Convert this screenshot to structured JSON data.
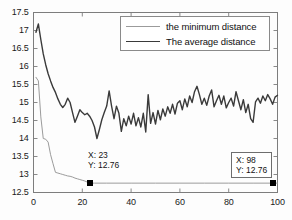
{
  "figure": {
    "background": "#ffffff",
    "axis_color": "#7d7d7d"
  },
  "legend": {
    "position": "top-right-inside",
    "entries": [
      {
        "label": "the minimum distance",
        "color": "#9b9b9b",
        "name": "legend-item-minimum"
      },
      {
        "label": "The average distance",
        "color": "#3a3a3a",
        "name": "legend-item-average"
      }
    ]
  },
  "datatips": [
    {
      "x_label": "X: 23",
      "y_label": "Y: 12.76",
      "x": 23,
      "y": 12.76,
      "boxed": false
    },
    {
      "x_label": "X: 98",
      "y_label": "Y: 12.76",
      "x": 98,
      "y": 12.76,
      "boxed": true
    }
  ],
  "axes": {
    "x_ticks": [
      "0",
      "20",
      "40",
      "60",
      "80",
      "100"
    ],
    "y_ticks": [
      "12.5",
      "13",
      "13.5",
      "14",
      "14.5",
      "15",
      "15.5",
      "16",
      "16.5",
      "17",
      "17.5"
    ]
  },
  "chart_data": {
    "type": "line",
    "title": "",
    "xlabel": "",
    "ylabel": "",
    "xlim": [
      0,
      100
    ],
    "ylim": [
      12.5,
      17.5
    ],
    "xticks": [
      0,
      20,
      40,
      60,
      80,
      100
    ],
    "yticks": [
      12.5,
      13,
      13.5,
      14,
      14.5,
      15,
      15.5,
      16,
      16.5,
      17,
      17.5
    ],
    "grid": false,
    "legend_position": "upper right",
    "annotations": [
      {
        "text": "X: 23\nY: 12.76",
        "x": 23,
        "y": 12.76
      },
      {
        "text": "X: 98\nY: 12.76",
        "x": 98,
        "y": 12.76
      }
    ],
    "series": [
      {
        "name": "the minimum distance",
        "color": "#9b9b9b",
        "width": 1,
        "x": [
          1,
          2,
          3,
          4,
          5,
          6,
          7,
          8,
          9,
          10,
          11,
          12,
          13,
          14,
          15,
          16,
          17,
          18,
          19,
          20,
          21,
          22,
          23,
          24,
          25,
          30,
          40,
          50,
          60,
          70,
          80,
          90,
          98,
          100
        ],
        "values": [
          15.7,
          15.6,
          14.6,
          14.0,
          13.98,
          13.9,
          13.55,
          13.3,
          13.06,
          13.04,
          13.02,
          13.0,
          12.98,
          12.96,
          12.95,
          12.93,
          12.9,
          12.88,
          12.86,
          12.84,
          12.82,
          12.79,
          12.76,
          12.76,
          12.76,
          12.76,
          12.76,
          12.76,
          12.76,
          12.76,
          12.76,
          12.76,
          12.76,
          12.76
        ]
      },
      {
        "name": "The average distance",
        "color": "#3a3a3a",
        "width": 1.4,
        "x": [
          1,
          2,
          3,
          4,
          5,
          6,
          7,
          8,
          9,
          10,
          11,
          12,
          13,
          14,
          15,
          16,
          17,
          18,
          19,
          20,
          21,
          22,
          23,
          24,
          25,
          26,
          27,
          28,
          29,
          30,
          31,
          32,
          33,
          34,
          35,
          36,
          37,
          38,
          39,
          40,
          41,
          42,
          43,
          44,
          45,
          46,
          47,
          48,
          49,
          50,
          51,
          52,
          53,
          54,
          55,
          56,
          57,
          58,
          59,
          60,
          61,
          62,
          63,
          64,
          65,
          66,
          67,
          68,
          69,
          70,
          71,
          72,
          73,
          74,
          75,
          76,
          77,
          78,
          79,
          80,
          81,
          82,
          83,
          84,
          85,
          86,
          87,
          88,
          89,
          90,
          91,
          92,
          93,
          94,
          95,
          96,
          97,
          98,
          99,
          100
        ],
        "values": [
          16.95,
          17.18,
          16.75,
          16.35,
          16.05,
          15.8,
          15.6,
          15.42,
          15.28,
          15.1,
          14.95,
          14.86,
          14.95,
          15.12,
          15.0,
          14.72,
          14.45,
          14.62,
          14.8,
          14.72,
          14.66,
          14.7,
          14.62,
          14.5,
          14.32,
          14.0,
          14.25,
          14.52,
          14.72,
          14.9,
          15.32,
          14.9,
          14.55,
          14.9,
          14.7,
          14.2,
          14.55,
          14.35,
          14.62,
          14.4,
          14.7,
          14.35,
          14.58,
          14.32,
          14.7,
          14.18,
          15.22,
          14.42,
          14.72,
          14.4,
          14.78,
          14.52,
          14.82,
          14.62,
          14.88,
          14.7,
          14.95,
          14.68,
          14.98,
          15.05,
          14.8,
          15.1,
          14.88,
          15.18,
          15.0,
          15.3,
          15.45,
          15.22,
          14.95,
          15.12,
          14.92,
          15.18,
          15.35,
          14.88,
          15.05,
          15.2,
          14.95,
          15.18,
          14.85,
          15.0,
          15.12,
          14.9,
          15.3,
          15.05,
          14.8,
          15.08,
          14.72,
          14.95,
          14.55,
          14.45,
          15.02,
          15.12,
          14.98,
          15.18,
          15.05,
          15.22,
          15.1,
          14.95,
          15.15,
          15.2
        ]
      }
    ]
  }
}
